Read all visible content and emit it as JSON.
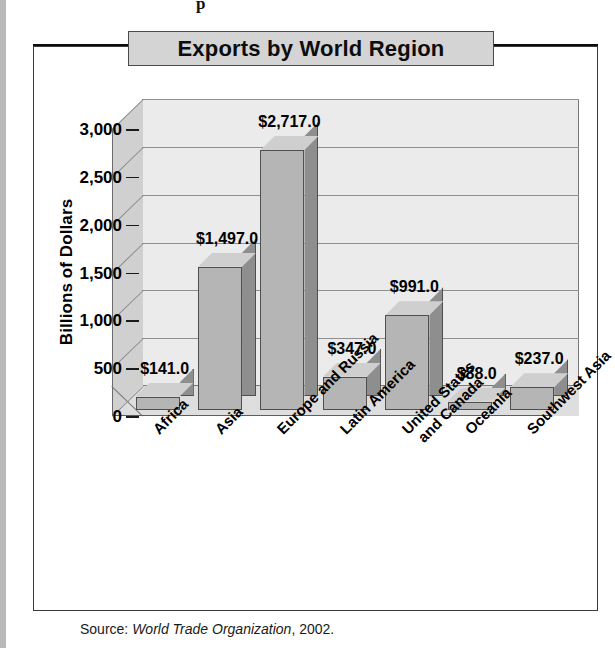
{
  "page": {
    "top_text": "p"
  },
  "figure": {
    "title": "Exports by World Region",
    "source": {
      "label": "Source:",
      "organization": "World Trade Organization",
      "year": ", 2002."
    }
  },
  "chart_data": {
    "type": "bar",
    "title": "Exports by World Region",
    "xlabel": "",
    "ylabel": "Billions of Dollars",
    "ylim": [
      0,
      3000
    ],
    "ytick_labels": [
      "0",
      "500",
      "1,000",
      "1,500",
      "2,000",
      "2,500",
      "3,000"
    ],
    "ytick_values": [
      0,
      500,
      1000,
      1500,
      2000,
      2500,
      3000
    ],
    "grid": true,
    "legend": "none",
    "categories": [
      "Africa",
      "Asia",
      "Europe and Russia",
      "Latin America",
      "United States and Canada",
      "Oceania",
      "Southwest Asia"
    ],
    "category_lines": [
      [
        "Africa"
      ],
      [
        "Asia"
      ],
      [
        "Europe and Russia"
      ],
      [
        "Latin America"
      ],
      [
        "United States",
        "and Canada"
      ],
      [
        "Oceania"
      ],
      [
        "Southwest Asia"
      ]
    ],
    "values": [
      141.0,
      1497.0,
      2717.0,
      347.0,
      991.0,
      88.0,
      237.0
    ],
    "data_labels": [
      "$141.0",
      "$1,497.0",
      "$2,717.0",
      "$347.0",
      "$991.0",
      "$88.0",
      "$237.0"
    ],
    "units": "Billions of Dollars"
  },
  "colors": {
    "bar_front": "#b5b5b5",
    "bar_side": "#8e8e8e",
    "bar_top": "#cfcfcf",
    "plot_back": "#ebebeb",
    "plot_left_wall": "#d0d0d0",
    "plot_floor": "#dedede",
    "title_plate": "#d4d4d4",
    "rule": "#0d0d0d",
    "text": "#000000"
  }
}
